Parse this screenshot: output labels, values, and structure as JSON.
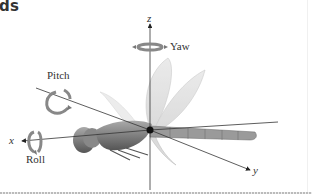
{
  "figure": {
    "title_fragment": "ds",
    "labels": {
      "yaw": "Yaw",
      "pitch": "Pitch",
      "roll": "Roll"
    },
    "axes": {
      "x": "x",
      "y": "y",
      "z": "z"
    }
  }
}
